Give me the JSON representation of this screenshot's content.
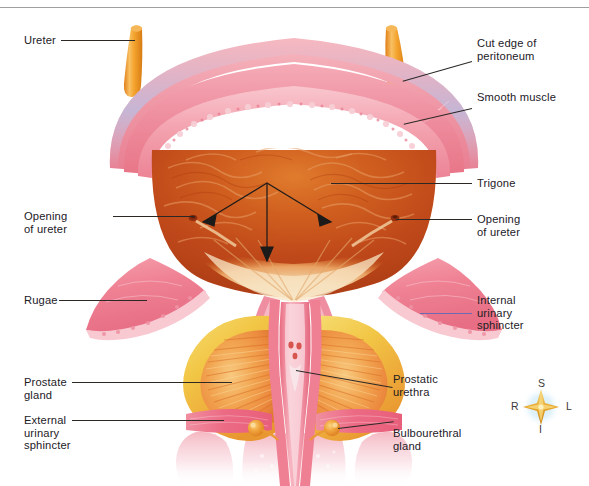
{
  "figure": {
    "width": 589,
    "height": 486,
    "background": "#ffffff",
    "top_rule_color": "#8e8e92"
  },
  "labels": {
    "ureter": "Ureter",
    "opening_of_ureter_left": "Opening\nof ureter",
    "rugae": "Rugae",
    "prostate_gland": "Prostate\ngland",
    "external_urinary_sphincter": "External\nurinary\nsphincter",
    "cut_edge_of_peritoneum": "Cut edge of\nperitoneum",
    "smooth_muscle": "Smooth muscle",
    "trigone": "Trigone",
    "opening_of_ureter_right": "Opening\nof ureter",
    "internal_urinary_sphincter": "Internal\nurinary\nsphincter",
    "prostatic_urethra": "Prostatic\nurethra",
    "bulbourethral_gland": "Bulbourethral\ngland"
  },
  "orientation_compass": {
    "superior": "S",
    "inferior": "I",
    "right": "R",
    "left": "L",
    "star_color": "#e8a62a",
    "glow_color": "#bfe3f2"
  },
  "colors": {
    "text": "#23201f",
    "leader_line": "#2b2826",
    "leader_line_violet": "#6d6ab0",
    "ureter_orange": "#f0992e",
    "peritoneum_pink": "#f2a8b2",
    "peritoneum_blue_tint": "#b9c3e6",
    "smooth_muscle_pink": "#ef8d9c",
    "mucosa_edge": "#f4a9b4",
    "bladder_interior_deep": "#b83f18",
    "bladder_interior_mid": "#d4651f",
    "bladder_interior_light": "#eeb07a",
    "trigone_cream": "#f6e3c2",
    "rugae_flap_pink": "#ef8496",
    "prostate_yellow": "#f2cf4c",
    "prostate_orange": "#f0a03a",
    "prostate_core": "#ef8d4a",
    "urethra_pink": "#ef7f92",
    "sphincter_band_pink": "#f06e86",
    "bulbourethral_orange": "#f0a33a",
    "faded_pink": "#f6c7d2"
  },
  "annotations": {
    "trigone_arrows": 3,
    "arrow_origin_note": "three arrows radiate from a central point to the two ureteric openings and down to the internal urethral orifice"
  }
}
